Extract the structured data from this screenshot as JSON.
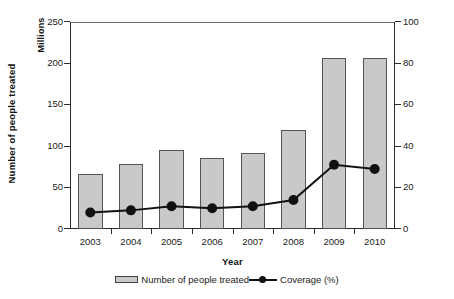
{
  "chart_data": {
    "type": "bar",
    "title": "",
    "xlabel": "Year",
    "categories": [
      "2003",
      "2004",
      "2005",
      "2006",
      "2007",
      "2008",
      "2009",
      "2010"
    ],
    "grid": false,
    "legend_position": "bottom",
    "axes": {
      "left": {
        "label": "Number of people treated",
        "unit": "Millions",
        "ylim": [
          0,
          250
        ],
        "ticks": [
          0,
          50,
          100,
          150,
          200,
          250
        ],
        "tick_labels": [
          "0",
          "50",
          "100",
          "150",
          "200",
          "250"
        ]
      },
      "right": {
        "label": "Coverage (%)",
        "ylim": [
          0,
          100
        ],
        "ticks": [
          0,
          20,
          40,
          60,
          80,
          100
        ],
        "tick_labels": [
          "0",
          "20",
          "40",
          "60",
          "80",
          "100"
        ]
      }
    },
    "series": [
      {
        "name": "Number of people treated",
        "type": "bar",
        "axis": "left",
        "color": "#c9c9c9",
        "edge_color": "#555555",
        "values": [
          66,
          79,
          95,
          86,
          92,
          119,
          206,
          207
        ]
      },
      {
        "name": "Coverage (%)",
        "type": "line",
        "axis": "right",
        "color": "#111111",
        "marker": "circle",
        "values": [
          8,
          9,
          11,
          10,
          11,
          14,
          31,
          29
        ]
      }
    ]
  },
  "legend": {
    "entries": [
      {
        "label": "Number of people treated",
        "swatch": "bar-swatch"
      },
      {
        "label": "Coverage (%)",
        "swatch": "line-marker-swatch"
      }
    ]
  }
}
